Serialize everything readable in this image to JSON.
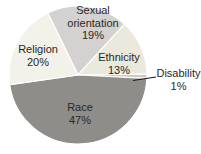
{
  "chart_data": {
    "type": "pie",
    "title": "",
    "legend": "none",
    "labels_on_slices": true,
    "start_angle_deg": -26,
    "direction": "clockwise",
    "slices": [
      {
        "label": "Sexual orientation",
        "value": 19,
        "pct": "19%",
        "color": "#d3d2d0"
      },
      {
        "label": "Ethnicity",
        "value": 13,
        "pct": "13%",
        "color": "#ebe9dd"
      },
      {
        "label": "Disability",
        "value": 1,
        "pct": "1%",
        "color": "#c9c9c5"
      },
      {
        "label": "Race",
        "value": 47,
        "pct": "47%",
        "color": "#8e8d8a"
      },
      {
        "label": "Religion",
        "value": 20,
        "pct": "20%",
        "color": "#f2f1ea"
      }
    ],
    "callout": {
      "slice": "Disability",
      "style": "leader-line",
      "line_color": "#1a1a1a"
    },
    "separator_color": "#ffffff",
    "text_color": "#2a2825"
  }
}
